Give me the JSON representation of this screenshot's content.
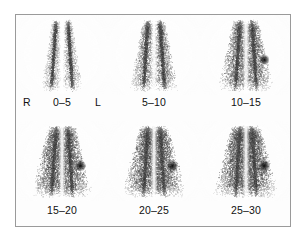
{
  "figure": {
    "border_color": "#9a9a9a",
    "background_color": "#fdfdfd",
    "ink_color": "#111111",
    "units": "minutes",
    "orientation": {
      "right_marker": "R",
      "left_marker": "L"
    },
    "grid": {
      "rows": 2,
      "cols": 3
    },
    "panels": [
      {
        "id": "panel-0-5",
        "label": "0–5",
        "row": 0,
        "col": 0,
        "interval_start": 0,
        "interval_end": 5,
        "intensity": 0.28,
        "spread": 0.26,
        "hot_spot": false
      },
      {
        "id": "panel-5-10",
        "label": "5–10",
        "row": 0,
        "col": 1,
        "interval_start": 5,
        "interval_end": 10,
        "intensity": 0.48,
        "spread": 0.46,
        "hot_spot": false
      },
      {
        "id": "panel-10-15",
        "label": "10–15",
        "row": 0,
        "col": 2,
        "interval_start": 10,
        "interval_end": 15,
        "intensity": 0.66,
        "spread": 0.66,
        "hot_spot": true
      },
      {
        "id": "panel-15-20",
        "label": "15–20",
        "row": 1,
        "col": 0,
        "interval_start": 15,
        "interval_end": 20,
        "intensity": 0.78,
        "spread": 0.82,
        "hot_spot": true
      },
      {
        "id": "panel-20-25",
        "label": "20–25",
        "row": 1,
        "col": 1,
        "interval_start": 20,
        "interval_end": 25,
        "intensity": 0.84,
        "spread": 0.9,
        "hot_spot": true
      },
      {
        "id": "panel-25-30",
        "label": "25–30",
        "row": 1,
        "col": 2,
        "interval_start": 25,
        "interval_end": 30,
        "intensity": 0.88,
        "spread": 0.95,
        "hot_spot": true
      }
    ]
  }
}
